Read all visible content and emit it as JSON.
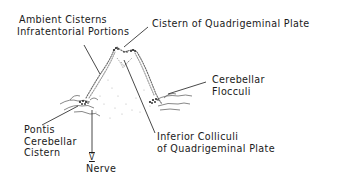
{
  "diagram": {
    "type": "anatomical-line-drawing",
    "colors": {
      "ink": "#1a1a1a",
      "stipple": "#8a8a8a",
      "background": "#ffffff"
    },
    "labels": {
      "ambient": {
        "line1": "Ambient Cisterns",
        "line2": "Infratentorial Portions"
      },
      "cistern_quad": {
        "line1": "Cistern of Quadrigeminal Plate"
      },
      "flocculi": {
        "line1": "Cerebellar",
        "line2": "Flocculi"
      },
      "pontis": {
        "line1": "Pontis",
        "line2": "Cerebellar",
        "line3": "Cistern"
      },
      "nerve": {
        "numeral": "V",
        "line1": "Nerve"
      },
      "colliculi": {
        "line1": "Inferior Colliculi",
        "line2": "of Quadrigeminal Plate"
      }
    }
  }
}
